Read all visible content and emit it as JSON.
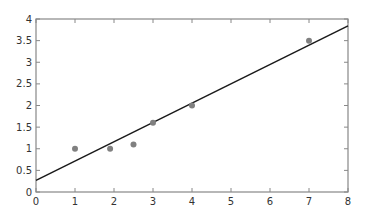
{
  "chart_data": {
    "type": "scatter",
    "title": "",
    "xlabel": "",
    "ylabel": "",
    "xlim": [
      0,
      8
    ],
    "ylim": [
      0,
      4
    ],
    "grid": false,
    "legend": null,
    "x_ticks": [
      "0",
      "1",
      "2",
      "3",
      "4",
      "5",
      "6",
      "7",
      "8"
    ],
    "y_ticks": [
      "0",
      "0.5",
      "1",
      "1.5",
      "2",
      "2.5",
      "3",
      "3.5",
      "4"
    ],
    "series": [
      {
        "name": "points",
        "kind": "scatter",
        "color": "#808080",
        "x": [
          1.0,
          1.9,
          2.5,
          3.0,
          4.0,
          7.0
        ],
        "y": [
          1.0,
          1.0,
          1.1,
          1.6,
          2.0,
          3.5
        ]
      },
      {
        "name": "fit-line",
        "kind": "line",
        "color": "#1a1a1a",
        "x": [
          0,
          8
        ],
        "y": [
          0.27,
          3.84
        ]
      }
    ]
  },
  "style": {
    "axis_color": "#888888",
    "text_color": "#333333"
  }
}
